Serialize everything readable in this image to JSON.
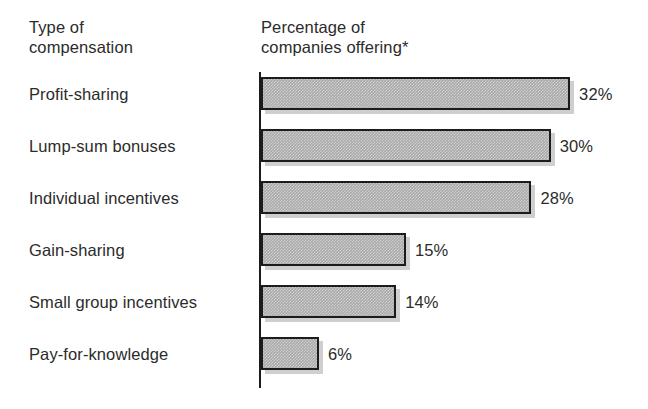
{
  "headers": {
    "left": "Type of\ncompensation",
    "right": "Percentage of\ncompanies offering*"
  },
  "chart_data": {
    "type": "bar",
    "orientation": "horizontal",
    "title": "",
    "xlabel": "Percentage of companies offering*",
    "ylabel": "Type of compensation",
    "footnote_marker": "*",
    "categories": [
      "Profit-sharing",
      "Lump-sum bonuses",
      "Individual incentives",
      "Gain-sharing",
      "Small group incentives",
      "Pay-for-knowledge"
    ],
    "values": [
      32,
      30,
      28,
      15,
      14,
      6
    ],
    "value_labels": [
      "32%",
      "30%",
      "28%",
      "15%",
      "14%",
      "6%"
    ],
    "unit": "%",
    "xlim": [
      0,
      32
    ],
    "grid": false,
    "legend": null,
    "bar_fill_color": "#a9a9a9",
    "bar_border_color": "#1c1c1c",
    "bar_shadow_color": "#cfcfcf",
    "axis_color": "#1c1c1c",
    "background_color": "#ffffff",
    "text_color": "#2b2b2b"
  },
  "layout": {
    "axis_x": 261,
    "bar_start_y": 77,
    "bar_height": 33,
    "row_pitch": 52,
    "px_per_unit": 9.66,
    "value_label_gap": 9
  }
}
